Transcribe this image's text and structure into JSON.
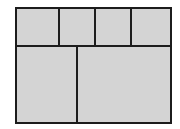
{
  "diagram": {
    "type": "grid-layout",
    "fill_color": "#d4d4d4",
    "stroke_color": "#1c1c1c",
    "rows": [
      {
        "name": "top-row",
        "cells": 4
      },
      {
        "name": "bottom-row",
        "cells": 2
      }
    ]
  }
}
